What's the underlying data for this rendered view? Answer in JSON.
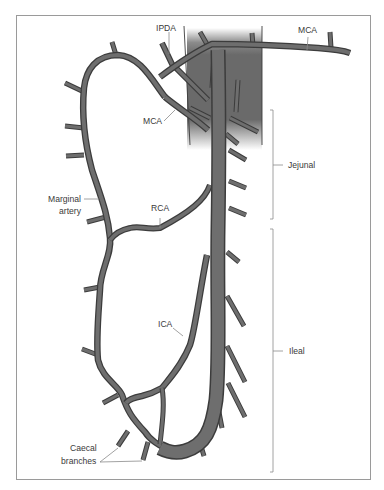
{
  "diagram": {
    "labels": {
      "ipda": "IPDA",
      "mca_top": "MCA",
      "mca_left": "MCA",
      "marginal_line1": "Marginal",
      "marginal_line2": "artery",
      "rca": "RCA",
      "ica": "ICA",
      "jejunal": "Jejunal",
      "ileal": "Ileal",
      "caecal_line1": "Caecal",
      "caecal_line2": "branches"
    },
    "colors": {
      "vessel_fill": "#6e6e6e",
      "vessel_outline": "#3c3c3c",
      "mesentery_shade": "#6a6a6a",
      "frame": "#9a9a9a",
      "label_text": "#3a3a3a",
      "leader_line": "#8a8a8a"
    },
    "brackets": [
      {
        "name": "Jejunal",
        "y_start": 110,
        "y_end": 219
      },
      {
        "name": "Ileal",
        "y_start": 229,
        "y_end": 472
      }
    ]
  }
}
